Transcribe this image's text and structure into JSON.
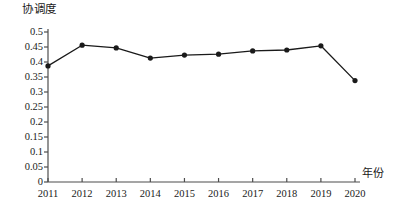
{
  "chart_data": {
    "type": "line",
    "title": "",
    "ylabel": "协调度",
    "xlabel": "年份",
    "categories": [
      "2011",
      "2012",
      "2013",
      "2014",
      "2015",
      "2016",
      "2017",
      "2018",
      "2019",
      "2020"
    ],
    "values": [
      0.387,
      0.456,
      0.447,
      0.413,
      0.423,
      0.426,
      0.437,
      0.44,
      0.454,
      0.338
    ],
    "series": [
      {
        "name": "协调度",
        "values": [
          0.387,
          0.456,
          0.447,
          0.413,
          0.423,
          0.426,
          0.437,
          0.44,
          0.454,
          0.338
        ]
      }
    ],
    "ylim": [
      0,
      0.5
    ],
    "yticks": [
      "0",
      "0.05",
      "0.1",
      "0.15",
      "0.2",
      "0.25",
      "0.3",
      "0.35",
      "0.4",
      "0.45",
      "0.5"
    ],
    "ytick_values": [
      0,
      0.05,
      0.1,
      0.15,
      0.2,
      0.25,
      0.3,
      0.35,
      0.4,
      0.45,
      0.5
    ],
    "xticks": [
      "2011",
      "2012",
      "2013",
      "2014",
      "2015",
      "2016",
      "2017",
      "2018",
      "2019",
      "2020"
    ],
    "grid": false,
    "legend": "none",
    "line_color": "#1a1a1a",
    "marker_color": "#1a1a1a",
    "axis_color": "#4d4d4d"
  }
}
